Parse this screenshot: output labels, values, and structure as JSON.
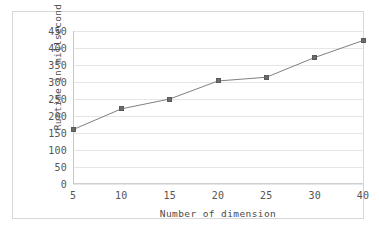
{
  "chart_data": {
    "type": "line",
    "title": "",
    "xlabel": "Number of dimension",
    "ylabel": "Runtime in millsecond",
    "categories": [
      "5",
      "10",
      "15",
      "20",
      "25",
      "30",
      "40"
    ],
    "x": [
      5,
      10,
      15,
      20,
      25,
      30,
      40
    ],
    "values": [
      160,
      221,
      250,
      303,
      314,
      372,
      422
    ],
    "series": [
      {
        "name": "Runtime",
        "values": [
          160,
          221,
          250,
          303,
          314,
          372,
          422
        ]
      }
    ],
    "ylim": [
      0,
      450
    ],
    "ytick_labels": [
      "0",
      "50",
      "100",
      "150",
      "200",
      "250",
      "300",
      "350",
      "400",
      "450"
    ],
    "yticks": [
      0,
      50,
      100,
      150,
      200,
      250,
      300,
      350,
      400,
      450
    ],
    "xtick_labels": [
      "5",
      "10",
      "15",
      "20",
      "25",
      "30",
      "40"
    ],
    "grid": "horizontal",
    "legend": "none",
    "marker": "square",
    "line_color": "#808080",
    "marker_color": "#6b6b6b",
    "grid_color": "#e6e6e6",
    "axis_color": "#c8c8c8",
    "background": "#ffffff"
  }
}
